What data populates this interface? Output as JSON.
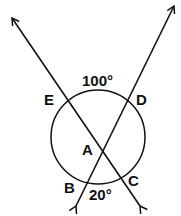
{
  "diagram": {
    "labels": {
      "A": "A",
      "B": "B",
      "C": "C",
      "D": "D",
      "E": "E"
    },
    "angles": {
      "arc_ED": "100°",
      "arc_BC": "20°"
    },
    "colors": {
      "stroke": "#111111",
      "background": "#ffffff"
    }
  }
}
